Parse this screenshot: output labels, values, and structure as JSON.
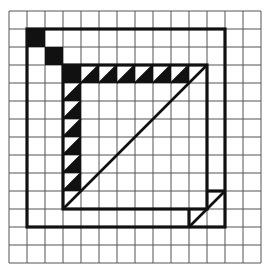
{
  "figure": {
    "title": "",
    "grid": {
      "cols": 14,
      "rows": 14,
      "origin_x": 9,
      "origin_y": 11,
      "cell": 18,
      "line_color": "#555555"
    },
    "ink_color": "#111111",
    "filled_cells": [
      [
        1,
        1
      ],
      [
        2,
        2
      ],
      [
        3,
        3
      ]
    ],
    "triangles_top_row": {
      "row": 3,
      "cols": [
        4,
        5,
        6,
        7,
        8,
        9
      ]
    },
    "triangles_left_col": {
      "col": 3,
      "rows": [
        4,
        5,
        6,
        7,
        8,
        9
      ]
    },
    "outer_square": {
      "x1": 1,
      "y1": 1,
      "x2": 12,
      "y2": 12
    },
    "inner_square": {
      "x1": 3,
      "y1": 3,
      "x2": 11,
      "y2": 11
    },
    "inner_diagonal": {
      "from": [
        3,
        11
      ],
      "to": [
        11,
        3
      ]
    },
    "corner_flap": {
      "h_from": [
        11,
        10
      ],
      "h_to": [
        12,
        10
      ],
      "v_from": [
        10,
        11
      ],
      "v_to": [
        10,
        12
      ],
      "diag_from": [
        10,
        12
      ],
      "diag_to": [
        12,
        10
      ]
    }
  }
}
